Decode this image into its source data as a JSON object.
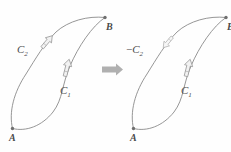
{
  "figure": {
    "width": 231,
    "height": 152,
    "background_color": "#fefefe",
    "curve_color": "#8a8a8a",
    "label_color": "#4a4a4a",
    "arrow_fill_color": "#f2f2f2",
    "transition_arrow_color": "#b0b0b0"
  },
  "left_panel": {
    "name": "original-orientation",
    "labels": {
      "point_a": "A",
      "point_b": "B",
      "curve_c1": "C",
      "curve_c1_sub": "1",
      "curve_c2": "C",
      "curve_c2_sub": "2",
      "curve_c2_sign": ""
    },
    "orientation": {
      "c1": "A-to-B",
      "c2": "A-to-B"
    }
  },
  "transition": {
    "name": "implies-arrow",
    "glyph": "right-block-arrow"
  },
  "right_panel": {
    "name": "reversed-orientation",
    "labels": {
      "point_a": "A",
      "point_b": "B",
      "curve_c1": "C",
      "curve_c1_sub": "1",
      "curve_c2": "C",
      "curve_c2_sub": "2",
      "curve_c2_sign": "−"
    },
    "orientation": {
      "c1": "A-to-B",
      "c2": "B-to-A"
    }
  }
}
